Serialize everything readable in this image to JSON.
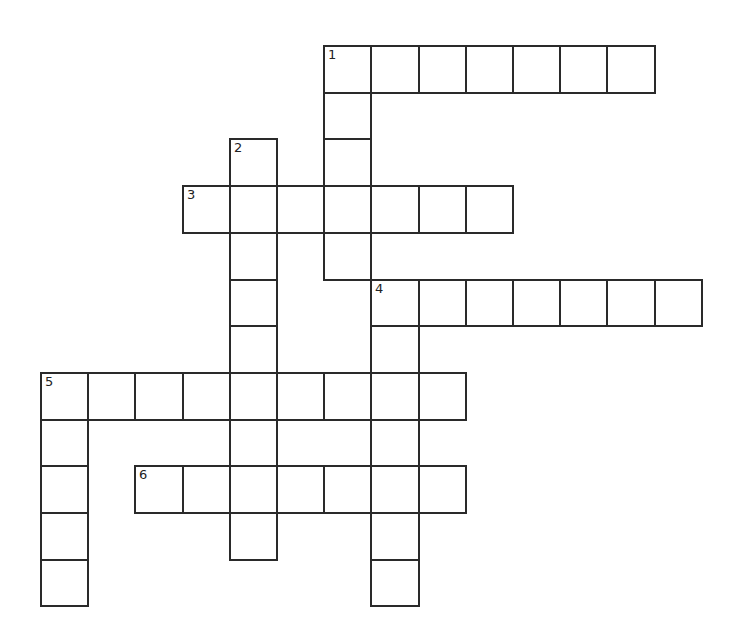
{
  "puzzle": {
    "type": "crossword",
    "grid": {
      "origin_x": 40,
      "origin_y": 45,
      "cell_w": 47.2,
      "cell_h": 46.7
    },
    "entries": [
      {
        "number": "1",
        "direction": "across",
        "row": 0,
        "col": 6,
        "length": 7
      },
      {
        "number": "1",
        "direction": "down",
        "row": 0,
        "col": 6,
        "length": 5
      },
      {
        "number": "2",
        "direction": "down",
        "row": 2,
        "col": 4,
        "length": 9
      },
      {
        "number": "3",
        "direction": "across",
        "row": 3,
        "col": 3,
        "length": 7
      },
      {
        "number": "4",
        "direction": "across",
        "row": 5,
        "col": 7,
        "length": 7
      },
      {
        "number": "4",
        "direction": "down",
        "row": 5,
        "col": 7,
        "length": 7
      },
      {
        "number": "5",
        "direction": "across",
        "row": 7,
        "col": 0,
        "length": 9
      },
      {
        "number": "5",
        "direction": "down",
        "row": 7,
        "col": 0,
        "length": 5
      },
      {
        "number": "6",
        "direction": "across",
        "row": 9,
        "col": 2,
        "length": 7
      }
    ],
    "labels": [
      {
        "number": "1",
        "row": 0,
        "col": 6
      },
      {
        "number": "2",
        "row": 2,
        "col": 4
      },
      {
        "number": "3",
        "row": 3,
        "col": 3
      },
      {
        "number": "4",
        "row": 5,
        "col": 7
      },
      {
        "number": "5",
        "row": 7,
        "col": 0
      },
      {
        "number": "6",
        "row": 9,
        "col": 2
      }
    ]
  }
}
